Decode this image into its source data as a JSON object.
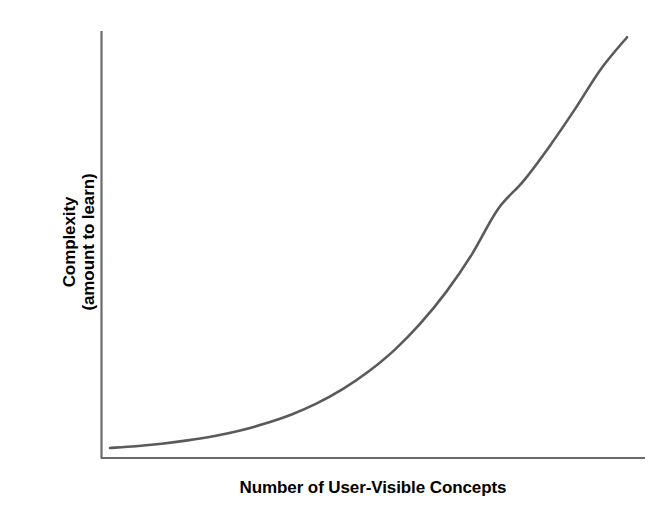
{
  "chart_data": {
    "type": "line",
    "title": "",
    "subtitle": "",
    "xlabel": "Number of User-Visible Concepts",
    "ylabel_line1": "Complexity",
    "ylabel_line2": "(amount to learn)",
    "ylabel_full": "Complexity (amount to learn)",
    "grid": false,
    "legend": "none",
    "axis_ticks": "none",
    "xlim": [
      0,
      100
    ],
    "ylim": [
      0,
      100
    ],
    "series": [
      {
        "name": "complexity-growth",
        "description": "Exponential growth of complexity with number of user-visible concepts",
        "color": "#5a5a5a",
        "x": [
          0,
          5,
          10,
          15,
          20,
          25,
          30,
          35,
          40,
          45,
          50,
          55,
          60,
          65,
          70,
          75,
          80,
          85,
          90,
          95,
          100
        ],
        "y": [
          1.2,
          1.6,
          2.2,
          3.0,
          4.0,
          5.3,
          7.0,
          9.1,
          11.8,
          15.2,
          19.4,
          24.5,
          30.8,
          38.3,
          47.3,
          58.0,
          64.8,
          73.0,
          82.0,
          91.5,
          99.0
        ]
      }
    ],
    "colors": {
      "curve": "#5a5a5a",
      "axis": "#6a6a6a",
      "label": "#000000",
      "background": "#ffffff"
    }
  },
  "figure": {
    "width": 672,
    "height": 514
  }
}
